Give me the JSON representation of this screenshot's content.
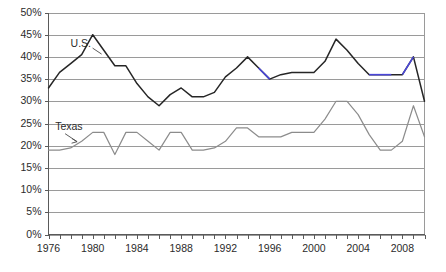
{
  "chart_data": {
    "type": "line",
    "title": "",
    "subtitle": "",
    "xlabel": "",
    "ylabel": "",
    "xlim": [
      1976,
      2010
    ],
    "ylim": [
      0,
      50
    ],
    "ytick_step": 5,
    "xtick_step": 1,
    "xlabel_step": 4,
    "grid": true,
    "legend_position": "inline-annotation",
    "x": [
      1976,
      1977,
      1978,
      1979,
      1980,
      1981,
      1982,
      1983,
      1984,
      1985,
      1986,
      1987,
      1988,
      1989,
      1990,
      1991,
      1992,
      1993,
      1994,
      1995,
      1996,
      1997,
      1998,
      1999,
      2000,
      2001,
      2002,
      2003,
      2004,
      2005,
      2006,
      2007,
      2008,
      2009,
      2010
    ],
    "y_tick_labels": [
      "0%",
      "5%",
      "10%",
      "15%",
      "20%",
      "25%",
      "30%",
      "35%",
      "40%",
      "45%",
      "50%"
    ],
    "y_tick_values": [
      0,
      5,
      10,
      15,
      20,
      25,
      30,
      35,
      40,
      45,
      50
    ],
    "x_tick_labels": [
      "1976",
      "1980",
      "1984",
      "1988",
      "1992",
      "1996",
      "2000",
      "2004",
      "2008"
    ],
    "x_tick_values": [
      1976,
      1980,
      1984,
      1988,
      1992,
      1996,
      2000,
      2004,
      2008
    ],
    "series": [
      {
        "name": "U.S.",
        "label": "U.S.",
        "color": "#262626",
        "highlight_color": "#4a46d8",
        "values": [
          33,
          36.5,
          38.5,
          40.5,
          45,
          41.5,
          38,
          38,
          34,
          31,
          29,
          31.5,
          33,
          31,
          31,
          32,
          35.5,
          37.5,
          40,
          37.5,
          35,
          36,
          36.5,
          36.5,
          36.5,
          39,
          44,
          41.5,
          38.5,
          36,
          36,
          36,
          36,
          40,
          30
        ]
      },
      {
        "name": "Texas",
        "label": "Texas",
        "color": "#8c8c8c",
        "values": [
          19,
          19,
          19.5,
          21,
          23,
          23,
          18,
          23,
          23,
          21,
          19,
          23,
          23,
          19,
          19,
          19.5,
          21,
          24,
          24,
          22,
          22,
          22,
          23,
          23,
          23,
          26,
          30,
          30,
          27,
          22.5,
          19,
          19,
          21,
          29,
          22
        ]
      }
    ],
    "annotations": [
      {
        "text": "U.S.",
        "series": "U.S.",
        "x": 1978.0,
        "y": 42.2
      },
      {
        "text": "Texas",
        "series": "Texas",
        "x": 1976.6,
        "y": 23.6
      }
    ]
  },
  "axes": {
    "y_axis_name": "percent-axis",
    "x_axis_name": "year-axis"
  }
}
